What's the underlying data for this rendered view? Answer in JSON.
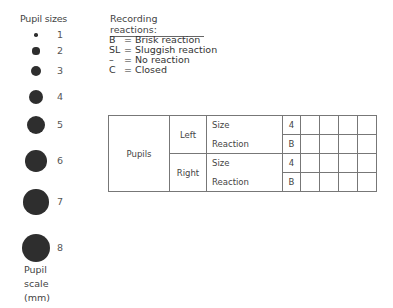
{
  "pupil_sizes": {
    "title": "Pupil sizes",
    "scale_label": [
      "Pupil",
      "scale",
      "(mm)"
    ],
    "sizes": [
      {
        "label": "1",
        "mm": 1
      },
      {
        "label": "2",
        "mm": 2
      },
      {
        "label": "3",
        "mm": 3
      },
      {
        "label": "4",
        "mm": 4
      },
      {
        "label": "5",
        "mm": 5
      },
      {
        "label": "6",
        "mm": 6
      },
      {
        "label": "7",
        "mm": 7
      },
      {
        "label": "8",
        "mm": 8
      }
    ]
  },
  "legend": {
    "title": "Recording reactions:",
    "items": [
      {
        "key": "B",
        "eq": "=",
        "meaning": "Brisk reaction"
      },
      {
        "key": "SL",
        "eq": "=",
        "meaning": "Sluggish reaction"
      },
      {
        "key": "–",
        "eq": "=",
        "meaning": "No reaction"
      },
      {
        "key": "C",
        "eq": "=",
        "meaning": "Closed"
      }
    ]
  },
  "table": {
    "group_label": "Pupils",
    "sides": [
      {
        "label": "Left",
        "rows": [
          {
            "param": "Size",
            "value": "4"
          },
          {
            "param": "Reaction",
            "value": "B"
          }
        ]
      },
      {
        "label": "Right",
        "rows": [
          {
            "param": "Size",
            "value": "4"
          },
          {
            "param": "Reaction",
            "value": "B"
          }
        ]
      }
    ],
    "blank_columns": 4
  }
}
